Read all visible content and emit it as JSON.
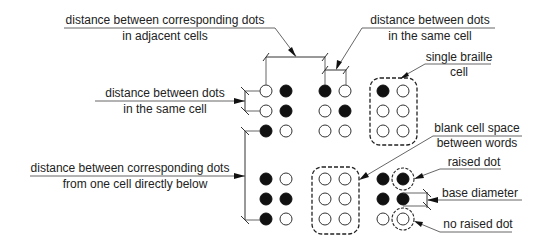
{
  "diagram": {
    "labels": {
      "adjacent_cells": {
        "line1": "distance between corresponding dots",
        "line2": "in adjacent cells"
      },
      "same_cell_top": {
        "line1": "distance between dots",
        "line2": "in the same cell"
      },
      "same_cell_left": {
        "line1": "distance between dots",
        "line2": "in the same cell"
      },
      "cell_below": {
        "line1": "distance between corresponding dots",
        "line2": "from one cell directly below"
      },
      "single_cell": {
        "line1": "single braille",
        "line2": "cell"
      },
      "blank_cell": {
        "line1": "blank cell space",
        "line2": "between words"
      },
      "raised_dot": "raised dot",
      "base_diameter": "base diameter",
      "no_raised_dot": "no raised dot"
    },
    "legend": {
      "raised": "filled black circle",
      "not_raised": "hollow circle"
    },
    "cells": [
      {
        "row": 0,
        "col": 0,
        "dots": [
          0,
          1,
          0,
          1,
          1,
          0
        ],
        "note": "dot grid, 3 rows x 2 cols, 1=raised"
      },
      {
        "row": 0,
        "col": 1,
        "dots": [
          1,
          0,
          0,
          1,
          0,
          0
        ]
      },
      {
        "row": 0,
        "col": 2,
        "dots": [
          1,
          0,
          0,
          0,
          0,
          0
        ],
        "highlight": "single braille cell"
      },
      {
        "row": 1,
        "col": 0,
        "dots": [
          1,
          0,
          1,
          1,
          1,
          0
        ]
      },
      {
        "row": 1,
        "col": 1,
        "dots": [
          0,
          0,
          0,
          0,
          0,
          0
        ],
        "highlight": "blank cell space"
      },
      {
        "row": 1,
        "col": 2,
        "dots": [
          1,
          1,
          1,
          1,
          0,
          0
        ],
        "annotated": [
          "raised dot",
          "base diameter",
          "no raised dot"
        ]
      }
    ],
    "colors": {
      "raised": "#111111",
      "flat": "#ffffff",
      "line": "#333333",
      "text": "#222222"
    }
  }
}
